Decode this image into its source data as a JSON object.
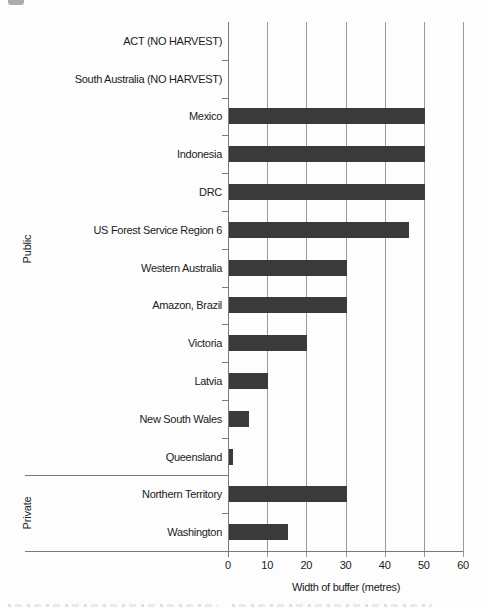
{
  "page": {
    "background": "#fdfdfd",
    "description_artifacts": {
      "top_left_smudge": true,
      "bottom_cutoff_caption": true
    }
  },
  "chart_data": {
    "type": "bar",
    "orientation": "horizontal",
    "title": "",
    "xlabel": "Width of buffer (metres)",
    "ylabel": "",
    "xlim": [
      0,
      60
    ],
    "x_ticks": [
      0,
      10,
      20,
      30,
      40,
      50,
      60
    ],
    "x_tick_labels": [
      "0",
      "10",
      "20",
      "30",
      "40",
      "50",
      "60"
    ],
    "grid": "vertical",
    "legend": "none",
    "categories": [
      "ACT (NO HARVEST)",
      "South Australia (NO HARVEST)",
      "Mexico",
      "Indonesia",
      "DRC",
      "US Forest Service Region 6",
      "Western Australia",
      "Amazon, Brazil",
      "Victoria",
      "Latvia",
      "New South Wales",
      "Queensland",
      "Northern Territory",
      "Washington"
    ],
    "values": [
      0,
      0,
      50,
      50,
      50,
      46,
      30,
      30,
      20,
      10,
      5,
      1,
      30,
      15
    ],
    "no_bar_reason": {
      "ACT (NO HARVEST)": "no harvest",
      "South Australia (NO HARVEST)": "no harvest"
    },
    "groups": [
      {
        "label": "Public",
        "start_index": 0,
        "end_index": 11
      },
      {
        "label": "Private",
        "start_index": 12,
        "end_index": 13
      }
    ],
    "colors": {
      "bar": "#3a3a3a",
      "gridline": "#9a9a9a",
      "axis": "#7a7a7a",
      "text": "#1b1b1b"
    }
  }
}
